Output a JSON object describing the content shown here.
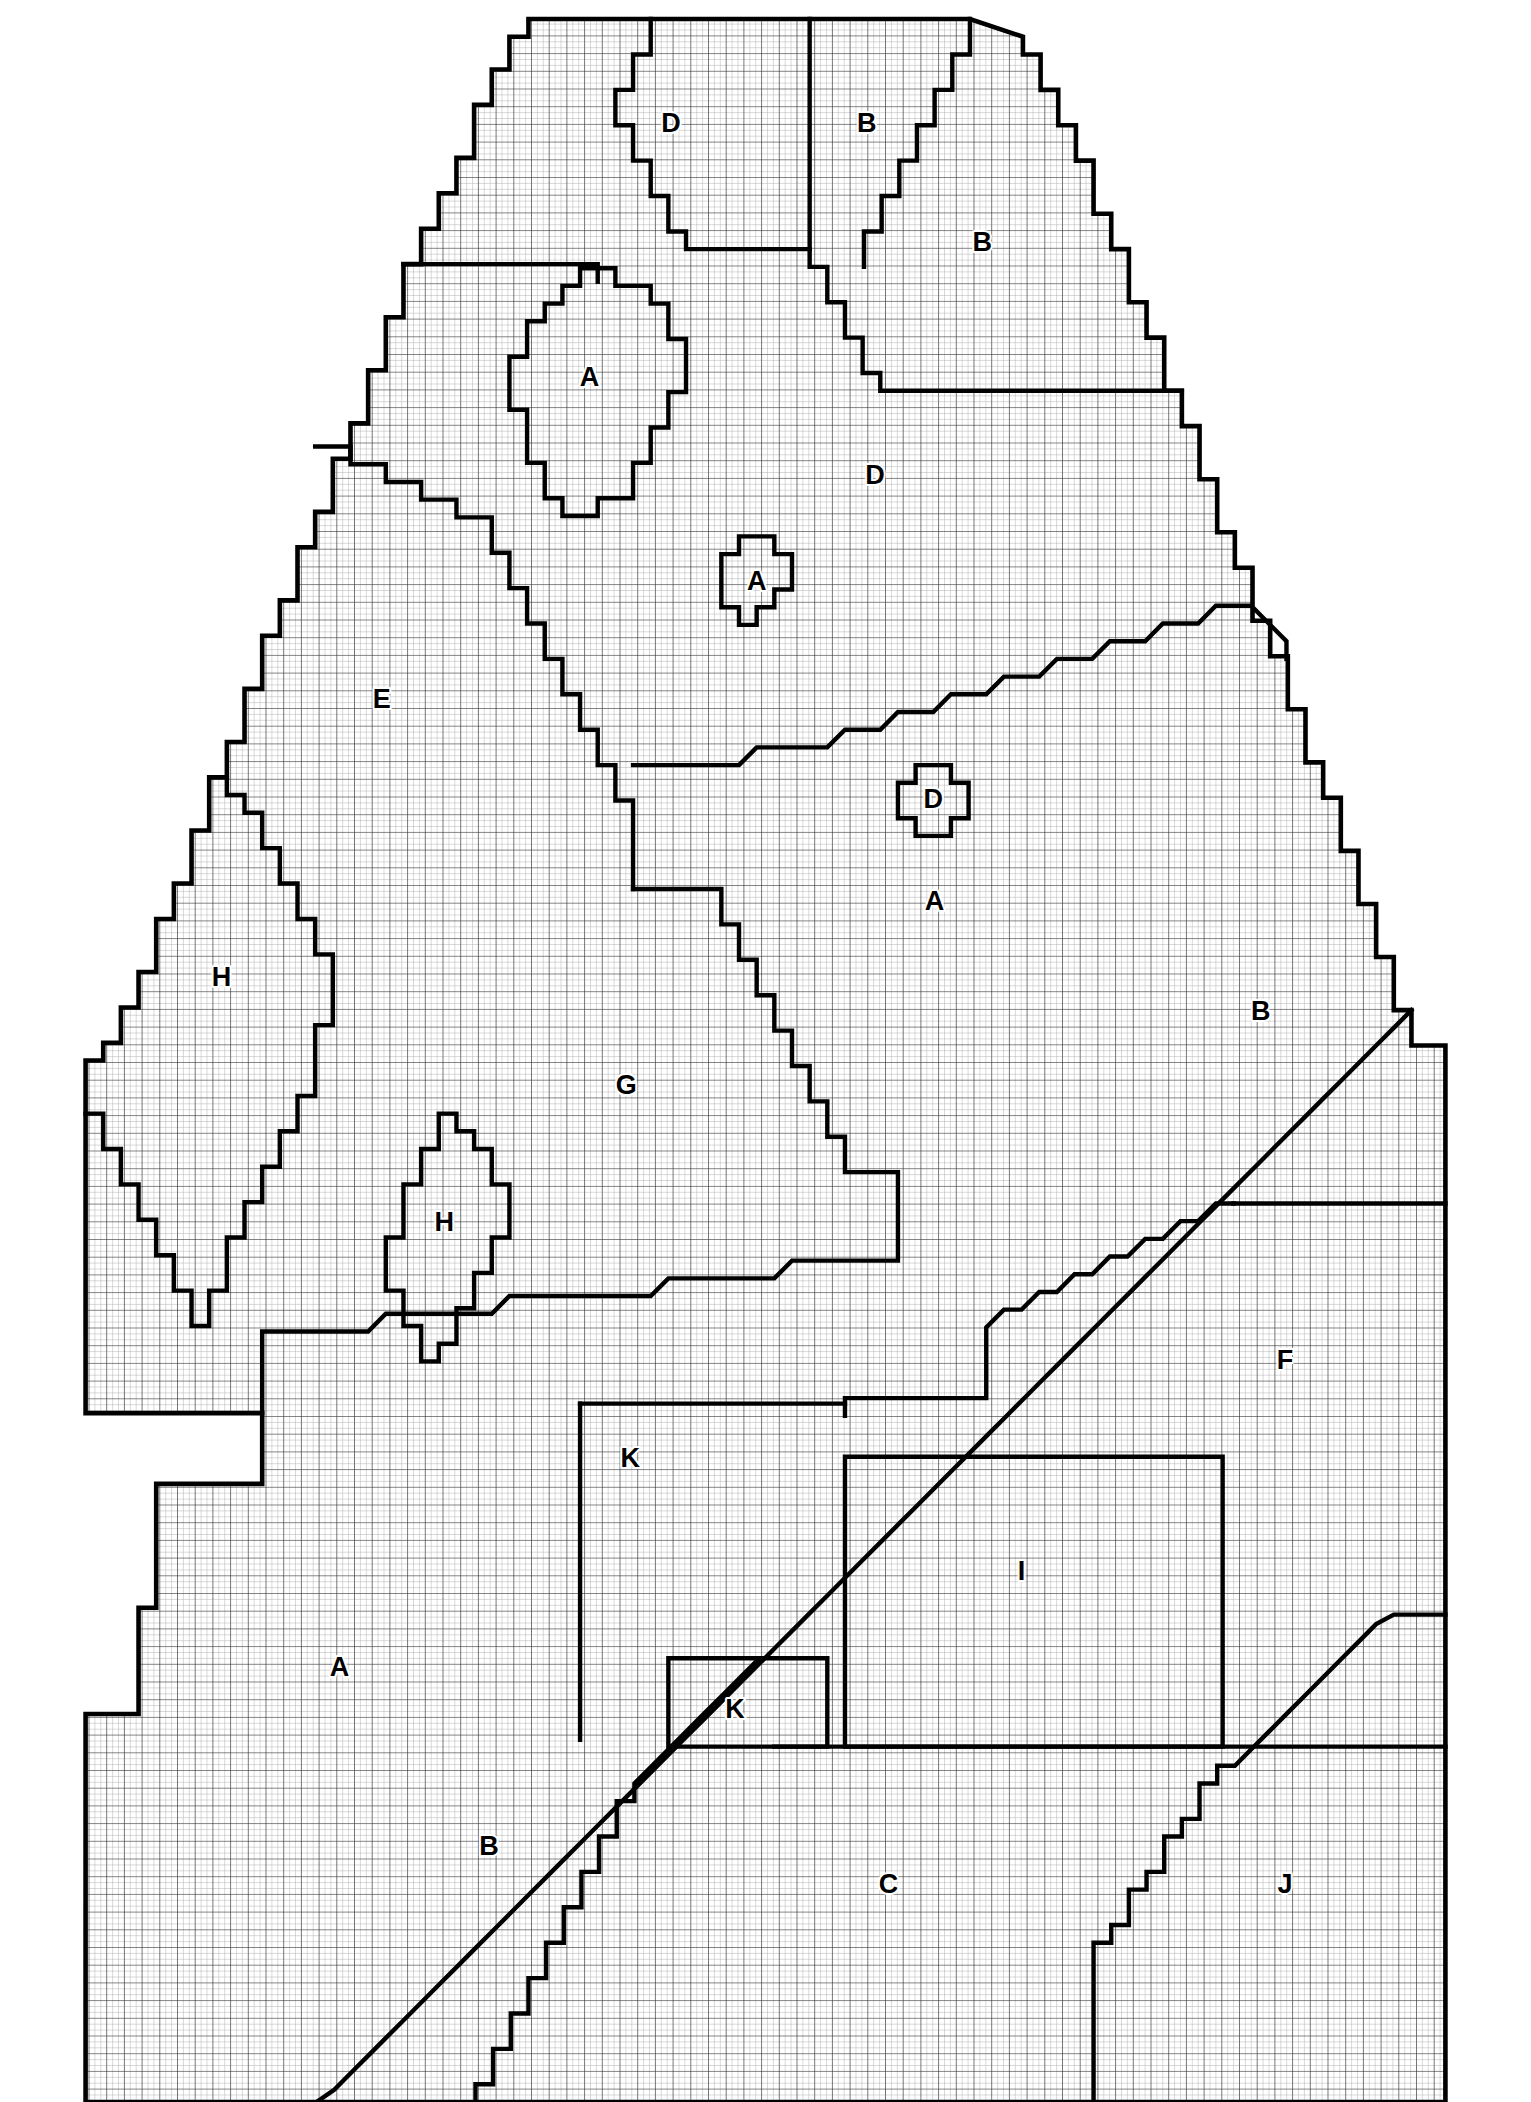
{
  "figure": {
    "kind": "grid-zoning-map",
    "background_color": "#ffffff",
    "line_color": "#000000",
    "minor_grid_color": "#8a8a8a",
    "major_grid_color": "#3a3a3a",
    "minor_grid_spacing_px": 4.33,
    "major_grid_spacing_px": 13,
    "boundary_stroke_px": 3.2,
    "canvas": {
      "width": 1531,
      "height": 2102
    }
  },
  "region_labels": [
    {
      "id": "D-top",
      "text": "D",
      "x": 494,
      "y": 92
    },
    {
      "id": "B-top",
      "text": "B",
      "x": 638,
      "y": 92
    },
    {
      "id": "B-upper-right",
      "text": "B",
      "x": 723,
      "y": 179
    },
    {
      "id": "A-oval-large",
      "text": "A",
      "x": 434,
      "y": 278
    },
    {
      "id": "D-upper-mid",
      "text": "D",
      "x": 644,
      "y": 350
    },
    {
      "id": "A-blob-small",
      "text": "A",
      "x": 557,
      "y": 428
    },
    {
      "id": "E-left",
      "text": "E",
      "x": 281,
      "y": 515
    },
    {
      "id": "D-blob-small",
      "text": "D",
      "x": 687,
      "y": 588
    },
    {
      "id": "A-mid-right",
      "text": "A",
      "x": 688,
      "y": 663
    },
    {
      "id": "H-left",
      "text": "H",
      "x": 163,
      "y": 719
    },
    {
      "id": "B-right",
      "text": "B",
      "x": 928,
      "y": 744
    },
    {
      "id": "G-center",
      "text": "G",
      "x": 461,
      "y": 798
    },
    {
      "id": "H-diamond",
      "text": "H",
      "x": 327,
      "y": 899
    },
    {
      "id": "F-right",
      "text": "F",
      "x": 946,
      "y": 1000
    },
    {
      "id": "K-upper",
      "text": "K",
      "x": 464,
      "y": 1072
    },
    {
      "id": "I-rect",
      "text": "I",
      "x": 752,
      "y": 1155
    },
    {
      "id": "A-lower-left",
      "text": "A",
      "x": 250,
      "y": 1226
    },
    {
      "id": "K-lower",
      "text": "K",
      "x": 541,
      "y": 1257
    },
    {
      "id": "B-bottom",
      "text": "B",
      "x": 360,
      "y": 1357
    },
    {
      "id": "C-bottom",
      "text": "C",
      "x": 654,
      "y": 1385
    },
    {
      "id": "J-bottom",
      "text": "J",
      "x": 946,
      "y": 1385
    }
  ],
  "legend_letters": [
    "A",
    "B",
    "C",
    "D",
    "E",
    "F",
    "G",
    "H",
    "I",
    "J",
    "K"
  ],
  "outer_boundary": "M 63,1272 L 63,1544 L 1064,1544 L 1064,1180 L 1064,778 L 930,466 L 753,14 L 595,14 L 389,14 L 63,778 Z",
  "paths": {
    "outline": "M 389,14 L 596,14 L 714,14 L 753,27 L 753,40 L 766,40 L 766,66 L 779,66 L 779,92 L 792,92 L 792,118 L 805,118 L 805,157 L 818,157 L 818,183 L 831,183 L 831,222 L 844,222 L 844,248 L 857,248 L 857,287 L 870,287 L 870,313 L 883,313 L 883,352 L 896,352 L 896,391 L 909,391 L 909,417 L 922,417 L 922,456 L 935,456 L 935,482 L 948,482 L 948,521 L 961,521 L 961,560 L 974,560 L 974,586 L 987,586 L 987,625 L 1000,625 L 1000,664 L 1013,664 L 1013,703 L 1026,703 L 1026,742 L 1039,742 L 1039,768 L 1064,768 L 1064,1544 L 63,1544 L 63,1272 L 63,1272 L 63,1259 L 102,1259 L 102,1181 L 115,1181 L 115,1090 L 193,1090 L 193,1090 L 193,1038 L 63,1038 L 63,779 L 76,779 L 76,766 L 89,766 L 89,740 L 102,740 L 102,714 L 115,714 L 115,675 L 128,675 L 128,649 L 141,649 L 141,610 L 154,610 L 154,571 L 167,571 L 167,545 L 180,545 L 180,506 L 193,506 L 193,467 L 206,467 L 206,441 L 219,441 L 219,402 L 232,402 L 232,376 L 245,376 L 245,337 L 258,337 L 258,311 L 271,311 L 271,272 L 284,272 L 284,233 L 297,233 L 297,194 L 310,194 L 310,168 L 323,168 L 323,142 L 336,142 L 336,116 L 349,116 L 349,77 L 362,77 L 362,51 L 375,51 L 375,27 L 389,27 Z"
  },
  "boundaries": [
    {
      "name": "top-D-left-wedge",
      "d": "M 479,14 L 479,27 L 479,40 L 466,40 L 466,66 L 453,66 L 453,92 L 466,92 L 466,118 L 479,118 L 479,144 L 492,144 L 492,170 L 505,170 L 505,183 L 596,183"
    },
    {
      "name": "top-vertical-D-B",
      "d": "M 596,14 L 596,183"
    },
    {
      "name": "B-top-wedge",
      "d": "M 596,183 L 596,196 L 609,196 L 609,222 L 622,222 L 622,248 L 635,248 L 635,274 L 648,274 L 648,287 L 870,287"
    },
    {
      "name": "B-top-right-ridge",
      "d": "M 714,14 L 714,40 L 701,40 L 701,66 L 688,66 L 688,92 L 675,92 L 675,118 L 662,118 L 662,144 L 649,144 L 649,170 L 636,170 L 636,196"
    },
    {
      "name": "E-upper-boundary",
      "d": "M 297,194 L 297,194 L 440,194 L 440,207"
    },
    {
      "name": "A-oval-large",
      "d": "M 427,197 L 453,197 L 453,210 L 479,210 L 479,223 L 492,223 L 492,249 L 505,249 L 505,288 L 492,288 L 492,314 L 479,314 L 479,340 L 466,340 L 466,366 L 440,366 L 440,379 L 414,379 L 414,366 L 401,366 L 401,340 L 388,340 L 388,301 L 375,301 L 375,262 L 388,262 L 388,236 L 401,236 L 401,223 L 414,223 L 414,210 L 427,210 Z"
    },
    {
      "name": "E-G-divider",
      "d": "M 232,328 L 258,328 L 258,341 L 284,341 L 284,354 L 310,354 L 310,367 L 336,367 L 336,380 L 362,380 L 362,406 L 375,406 L 375,432 L 388,432 L 388,458 L 401,458 L 401,484 L 414,484 L 414,510 L 427,510 L 427,536 L 440,536 L 440,562 L 453,562 L 453,588 L 466,588 L 466,614 L 466,653"
    },
    {
      "name": "A-small-blob",
      "d": "M 544,394 L 570,394 L 570,407 L 583,407 L 583,433 L 570,433 L 570,446 L 557,446 L 557,459 L 544,459 L 544,446 L 531,446 L 531,420 L 531,407 L 544,407 Z"
    },
    {
      "name": "D-A-divider-mid",
      "d": "M 466,562 L 531,562 L 544,562 L 557,549 L 583,549 L 609,549 L 622,536 L 648,536 L 661,523 L 687,523 L 700,510 L 726,510 L 739,497 L 765,497 L 778,484 L 804,484 L 817,471 L 843,471 L 856,458 L 882,458 L 895,445 L 921,445 L 934,458 L 947,471 L 947,484"
    },
    {
      "name": "D-small-blob",
      "d": "M 674,562 L 700,562 L 700,575 L 713,575 L 713,601 L 700,601 L 700,614 L 674,614 L 674,601 L 661,601 L 661,575 L 674,575 Z"
    },
    {
      "name": "H-left-V-outer",
      "d": "M 167,571 L 167,584 L 180,584 L 180,597 L 193,597 L 193,623 L 206,623 L 206,649 L 219,649 L 219,675 L 232,675 L 232,701 L 245,701 L 245,727 L 245,753 L 232,753 L 232,779 L 232,805 L 219,805 L 219,831 L 206,831 L 206,857 L 193,857 L 193,883 L 180,883 L 180,909 L 167,909 L 167,948 L 154,948 L 154,974 L 141,974 L 141,948 L 128,948 L 128,922 L 115,922 L 115,896 L 102,896 L 102,870 L 89,870 L 89,844 L 76,844 L 76,818 L 63,818"
    },
    {
      "name": "G-A-main-diagonal",
      "d": "M 466,653 L 531,653 L 531,679 L 544,679 L 544,705 L 557,705 L 557,731 L 570,731 L 570,757 L 583,757 L 583,783 L 596,783 L 596,809 L 609,809 L 609,835 L 622,835 L 622,861 L 648,861 L 661,861 L 661,900 L 661,926 L 635,926 L 609,926 L 583,926 L 570,939 L 544,939 L 518,939 L 492,939 L 479,952 L 453,952 L 427,952 L 401,952 L 375,952 L 362,965 L 336,965 L 310,965 L 284,965 L 271,978 L 245,978 L 219,978 L 193,978 L 193,1038"
    },
    {
      "name": "A-B-big-diagonal",
      "d": "M 1039,742 L 1026,755 L 1013,768 L 1000,781 L 987,794 L 974,807 L 961,820 L 948,833 L 935,846 L 922,859 L 909,872 L 896,885 L 883,898 L 870,911 L 857,924 L 844,937 L 831,950 L 818,963 L 805,976 L 792,989 L 779,1002 L 766,1015 L 753,1028 L 740,1041 L 727,1054 L 714,1067 L 701,1080 L 688,1093 L 675,1106 L 662,1119 L 649,1132 L 636,1145 L 623,1158 L 610,1171 L 597,1184 L 584,1197 L 571,1210 L 558,1223 L 545,1236 L 532,1249 L 519,1262 L 506,1275 L 493,1288 L 480,1301 L 467,1314 L 454,1327 L 441,1340 L 428,1353 L 415,1366 L 402,1379 L 389,1392 L 376,1405 L 363,1418 L 350,1431 L 337,1444 L 324,1457 L 311,1470 L 298,1483 L 285,1496 L 272,1509 L 259,1522 L 246,1535 L 233,1544"
    },
    {
      "name": "H-diamond",
      "d": "M 323,818 L 336,818 L 336,831 L 349,831 L 349,844 L 362,844 L 362,870 L 375,870 L 375,909 L 362,909 L 362,935 L 349,935 L 349,961 L 336,961 L 336,987 L 323,987 L 323,1000 L 310,1000 L 310,974 L 297,974 L 297,948 L 284,948 L 284,909 L 297,909 L 297,870 L 310,870 L 310,844 L 323,844 Z"
    },
    {
      "name": "F-B-divider",
      "d": "M 908,884 L 1064,884 L 1064,884"
    },
    {
      "name": "F-G-divider",
      "d": "M 908,884 L 895,884 L 882,897 L 869,897 L 856,910 L 843,910 L 830,923 L 817,923 L 804,936 L 791,936 L 778,949 L 765,949 L 752,962 L 739,962 L 726,975 L 726,1001 L 726,1027 L 648,1027 L 622,1027 L 622,1040"
    },
    {
      "name": "K-upper-box",
      "d": "M 427,1031 L 427,1044 L 427,1070 L 427,1096 L 427,1122 L 427,1148 L 427,1174 L 427,1200 L 427,1226 L 427,1252 L 427,1278"
    },
    {
      "name": "K-upper-top",
      "d": "M 427,1031 L 492,1031 L 518,1031 L 544,1031 L 570,1031 L 596,1031 L 622,1031"
    },
    {
      "name": "I-rect",
      "d": "M 622,1070 L 900,1070 L 900,1283 L 622,1283 Z"
    },
    {
      "name": "K-lower-box",
      "d": "M 492,1218 L 609,1218 L 609,1283 L 492,1283 Z"
    },
    {
      "name": "C-top-edge",
      "d": "M 570,1283 L 805,1283 L 900,1283 L 1064,1283"
    },
    {
      "name": "C-J-divider",
      "d": "M 805,1544 L 805,1427 L 818,1427 L 818,1414 L 831,1414 L 831,1388 L 844,1388 L 844,1375 L 857,1375 L 857,1349 L 870,1349 L 870,1336 L 883,1336 L 883,1310 L 896,1310 L 896,1297 L 909,1297 L 922,1284 L 935,1271 L 948,1258 L 961,1245 L 974,1232 L 987,1219 L 1000,1206 L 1013,1193 L 1026,1186 L 1064,1186"
    },
    {
      "name": "A-B-lower-diagonal",
      "d": "M 350,1544 L 350,1531 L 363,1531 L 363,1505 L 376,1505 L 376,1479 L 389,1479 L 389,1453 L 402,1453 L 402,1427 L 415,1427 L 415,1401 L 428,1401 L 428,1375 L 441,1375 L 441,1349 L 454,1349 L 454,1323 L 467,1323 L 467,1310 L 480,1297 L 493,1284 L 506,1271 L 519,1258 L 532,1245 L 545,1232 L 558,1219"
    }
  ]
}
